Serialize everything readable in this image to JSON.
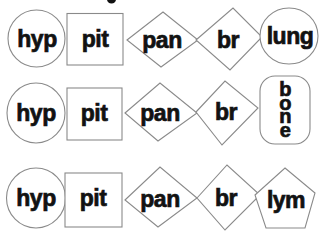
{
  "diagram": {
    "rows": [
      {
        "name": "row-1",
        "shapes": [
          {
            "type": "circle",
            "label": "hyp"
          },
          {
            "type": "square",
            "label": "pit"
          },
          {
            "type": "diamond",
            "label": "pan"
          },
          {
            "type": "diamond",
            "label": "br"
          },
          {
            "type": "circle",
            "label": "lung"
          }
        ]
      },
      {
        "name": "row-2",
        "shapes": [
          {
            "type": "circle",
            "label": "hyp"
          },
          {
            "type": "square",
            "label": "pit"
          },
          {
            "type": "diamond",
            "label": "pan"
          },
          {
            "type": "diamond",
            "label": "br"
          },
          {
            "type": "rounded-rect",
            "label": "bone",
            "orientation": "vertical",
            "letters": [
              "b",
              "o",
              "n",
              "e"
            ]
          }
        ]
      },
      {
        "name": "row-3",
        "shapes": [
          {
            "type": "circle",
            "label": "hyp"
          },
          {
            "type": "square",
            "label": "pit"
          },
          {
            "type": "diamond",
            "label": "pan"
          },
          {
            "type": "diamond",
            "label": "br"
          },
          {
            "type": "pentagon",
            "label": "lym"
          }
        ]
      }
    ],
    "artifact": "small cropped character fragment at top edge"
  },
  "colors": {
    "background": "#ffffff",
    "outline": "#8a8a8a",
    "ink": "#121212"
  }
}
